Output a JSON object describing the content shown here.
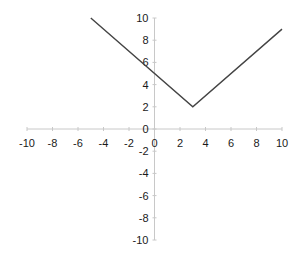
{
  "chart_data": {
    "type": "line",
    "title": "",
    "xlabel": "",
    "ylabel": "",
    "xlim": [
      -10,
      10
    ],
    "ylim": [
      -10,
      10
    ],
    "x_ticks": [
      -10,
      -8,
      -6,
      -4,
      -2,
      0,
      2,
      4,
      6,
      8,
      10
    ],
    "y_ticks": [
      -10,
      -8,
      -6,
      -4,
      -2,
      0,
      2,
      4,
      6,
      8,
      10
    ],
    "grid": false,
    "legend": null,
    "axes_cross_at_origin": true,
    "series": [
      {
        "name": "y = |x - 3| + 2",
        "color": "#444444",
        "x": [
          -5,
          3,
          10
        ],
        "y": [
          10,
          2,
          9
        ]
      }
    ]
  },
  "colors": {
    "axis": "#c8c8c8",
    "line": "#444444",
    "text": "#1a1a1a",
    "background": "#ffffff"
  }
}
